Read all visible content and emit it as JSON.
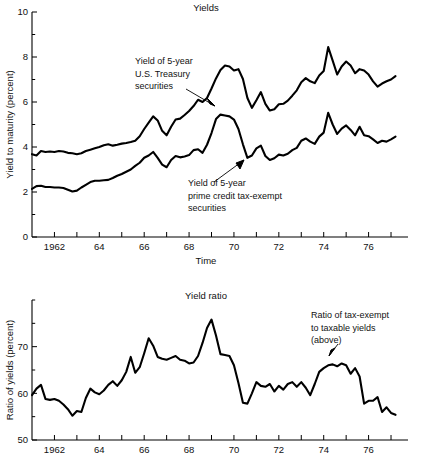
{
  "figure": {
    "background": "#ffffff",
    "line_color": "#000000"
  },
  "chart_data": [
    {
      "id": "yields",
      "type": "line",
      "title": "Yields",
      "xlabel": "Time",
      "ylabel": "Yield to maturity (percent)",
      "xlim": [
        1961.0,
        1977.4
      ],
      "ylim": [
        0,
        10
      ],
      "yticks": [
        0,
        2,
        4,
        6,
        8,
        10
      ],
      "ytick_labels": [
        "0",
        "2",
        "4",
        "6",
        "8",
        "10"
      ],
      "yminor_step": 1,
      "xticks": [
        1962,
        1963,
        1964,
        1965,
        1966,
        1967,
        1968,
        1969,
        1970,
        1971,
        1972,
        1973,
        1974,
        1975,
        1976,
        1977
      ],
      "xtick_labels": [
        "1962",
        "",
        "64",
        "",
        "66",
        "",
        "68",
        "",
        "70",
        "",
        "72",
        "",
        "74",
        "",
        "76",
        ""
      ],
      "grid": false,
      "legend": "none",
      "annotations": [
        {
          "id": "treasury-annotation",
          "text_lines": [
            "Yield of 5-year",
            "U.S. Treasury",
            "securities"
          ],
          "points_to": "upper line near 1968.4, 6.1"
        },
        {
          "id": "tax-exempt-annotation",
          "text_lines": [
            "Yield of 5-year",
            "prime credit tax-exempt",
            "securities"
          ],
          "points_to": "lower line near 1970.5, 3.5"
        }
      ],
      "series": [
        {
          "name": "Yield of 5-year U.S. Treasury securities",
          "x": [
            1961.0,
            1961.2,
            1961.4,
            1961.6,
            1961.8,
            1962.0,
            1962.2,
            1962.4,
            1962.6,
            1962.8,
            1963.0,
            1963.2,
            1963.4,
            1963.6,
            1963.8,
            1964.0,
            1964.2,
            1964.4,
            1964.6,
            1964.8,
            1965.0,
            1965.2,
            1965.4,
            1965.6,
            1965.8,
            1966.0,
            1966.2,
            1966.4,
            1966.6,
            1966.8,
            1967.0,
            1967.2,
            1967.4,
            1967.6,
            1967.8,
            1968.0,
            1968.2,
            1968.4,
            1968.6,
            1968.8,
            1969.0,
            1969.2,
            1969.4,
            1969.6,
            1969.8,
            1970.0,
            1970.2,
            1970.4,
            1970.6,
            1970.8,
            1971.0,
            1971.2,
            1971.4,
            1971.6,
            1971.8,
            1972.0,
            1972.2,
            1972.4,
            1972.6,
            1972.8,
            1973.0,
            1973.2,
            1973.4,
            1973.6,
            1973.8,
            1974.0,
            1974.2,
            1974.4,
            1974.6,
            1974.8,
            1975.0,
            1975.2,
            1975.4,
            1975.6,
            1975.8,
            1976.0,
            1976.2,
            1976.4,
            1976.6,
            1976.8,
            1977.0,
            1977.2
          ],
          "y": [
            3.68,
            3.62,
            3.82,
            3.78,
            3.8,
            3.78,
            3.82,
            3.8,
            3.74,
            3.72,
            3.68,
            3.72,
            3.82,
            3.88,
            3.94,
            4.0,
            4.08,
            4.12,
            4.06,
            4.1,
            4.15,
            4.18,
            4.22,
            4.28,
            4.48,
            4.8,
            5.08,
            5.36,
            5.18,
            4.72,
            4.52,
            4.9,
            5.22,
            5.26,
            5.42,
            5.6,
            5.82,
            6.1,
            6.0,
            6.18,
            6.6,
            7.05,
            7.42,
            7.62,
            7.58,
            7.4,
            7.46,
            7.02,
            6.18,
            5.74,
            6.08,
            6.44,
            5.92,
            5.62,
            5.68,
            5.9,
            5.92,
            6.06,
            6.28,
            6.52,
            6.88,
            7.06,
            6.92,
            6.84,
            7.18,
            7.38,
            8.44,
            7.84,
            7.22,
            7.58,
            7.8,
            7.62,
            7.28,
            7.46,
            7.4,
            7.22,
            6.92,
            6.68,
            6.82,
            6.92,
            7.0,
            7.15
          ]
        },
        {
          "name": "Yield of 5-year prime credit tax-exempt securities",
          "x": [
            1961.0,
            1961.2,
            1961.4,
            1961.6,
            1961.8,
            1962.0,
            1962.2,
            1962.4,
            1962.6,
            1962.8,
            1963.0,
            1963.2,
            1963.4,
            1963.6,
            1963.8,
            1964.0,
            1964.2,
            1964.4,
            1964.6,
            1964.8,
            1965.0,
            1965.2,
            1965.4,
            1965.6,
            1965.8,
            1966.0,
            1966.2,
            1966.4,
            1966.6,
            1966.8,
            1967.0,
            1967.2,
            1967.4,
            1967.6,
            1967.8,
            1968.0,
            1968.2,
            1968.4,
            1968.6,
            1968.8,
            1969.0,
            1969.2,
            1969.4,
            1969.6,
            1969.8,
            1970.0,
            1970.2,
            1970.4,
            1970.6,
            1970.8,
            1971.0,
            1971.2,
            1971.4,
            1971.6,
            1971.8,
            1972.0,
            1972.2,
            1972.4,
            1972.6,
            1972.8,
            1973.0,
            1973.2,
            1973.4,
            1973.6,
            1973.8,
            1974.0,
            1974.2,
            1974.4,
            1974.6,
            1974.8,
            1975.0,
            1975.2,
            1975.4,
            1975.6,
            1975.8,
            1976.0,
            1976.2,
            1976.4,
            1976.6,
            1976.8,
            1977.0,
            1977.2
          ],
          "y": [
            2.14,
            2.26,
            2.28,
            2.22,
            2.22,
            2.2,
            2.2,
            2.18,
            2.1,
            2.02,
            2.06,
            2.2,
            2.32,
            2.44,
            2.5,
            2.5,
            2.52,
            2.54,
            2.62,
            2.72,
            2.8,
            2.9,
            3.0,
            3.16,
            3.3,
            3.52,
            3.62,
            3.78,
            3.52,
            3.22,
            3.1,
            3.42,
            3.6,
            3.54,
            3.58,
            3.64,
            3.86,
            3.9,
            3.74,
            4.1,
            4.62,
            5.24,
            5.44,
            5.4,
            5.36,
            5.22,
            4.8,
            4.12,
            3.52,
            3.62,
            3.94,
            4.06,
            3.6,
            3.42,
            3.5,
            3.66,
            3.62,
            3.7,
            3.86,
            3.96,
            4.28,
            4.38,
            4.24,
            4.14,
            4.46,
            4.64,
            5.52,
            5.0,
            4.58,
            4.82,
            4.96,
            4.76,
            4.52,
            4.9,
            4.52,
            4.48,
            4.34,
            4.18,
            4.28,
            4.24,
            4.34,
            4.46
          ]
        }
      ]
    },
    {
      "id": "yield-ratio",
      "type": "line",
      "title": "Yield ratio",
      "xlabel": "",
      "ylabel": "Ratio of yields (percent)",
      "xlim": [
        1961.0,
        1977.4
      ],
      "ylim": [
        50,
        80
      ],
      "yticks": [
        50,
        60,
        70
      ],
      "ytick_labels": [
        "50",
        "60",
        "70"
      ],
      "yminor_step": 5,
      "xticks": [
        1962,
        1963,
        1964,
        1965,
        1966,
        1967,
        1968,
        1969,
        1970,
        1971,
        1972,
        1973,
        1974,
        1975,
        1976,
        1977
      ],
      "xtick_labels": [
        "1962",
        "",
        "64",
        "",
        "66",
        "",
        "68",
        "",
        "70",
        "",
        "72",
        "",
        "74",
        "",
        "76",
        ""
      ],
      "grid": false,
      "legend": "none",
      "annotations": [
        {
          "id": "ratio-annotation",
          "text_lines": [
            "Ratio of tax-exempt",
            "to taxable yields",
            "(above)"
          ],
          "points_to": "line near 1975.2, 66"
        }
      ],
      "series": [
        {
          "name": "Ratio of tax-exempt to taxable yields",
          "x": [
            1961.0,
            1961.2,
            1961.4,
            1961.6,
            1961.8,
            1962.0,
            1962.2,
            1962.4,
            1962.6,
            1962.8,
            1963.0,
            1963.2,
            1963.4,
            1963.6,
            1963.8,
            1964.0,
            1964.2,
            1964.4,
            1964.6,
            1964.8,
            1965.0,
            1965.2,
            1965.4,
            1965.6,
            1965.8,
            1966.0,
            1966.2,
            1966.4,
            1966.6,
            1966.8,
            1967.0,
            1967.2,
            1967.4,
            1967.6,
            1967.8,
            1968.0,
            1968.2,
            1968.4,
            1968.6,
            1968.8,
            1969.0,
            1969.2,
            1969.4,
            1969.6,
            1969.8,
            1970.0,
            1970.2,
            1970.4,
            1970.6,
            1970.8,
            1971.0,
            1971.2,
            1971.4,
            1971.6,
            1971.8,
            1972.0,
            1972.2,
            1972.4,
            1972.6,
            1972.8,
            1973.0,
            1973.2,
            1973.4,
            1973.6,
            1973.8,
            1974.0,
            1974.2,
            1974.4,
            1974.6,
            1974.8,
            1975.0,
            1975.2,
            1975.4,
            1975.6,
            1975.8,
            1976.0,
            1976.2,
            1976.4,
            1976.6,
            1976.8,
            1977.0,
            1977.2
          ],
          "y": [
            59.6,
            61.0,
            61.8,
            58.8,
            58.6,
            58.8,
            58.4,
            57.6,
            56.6,
            55.2,
            56.2,
            56.0,
            59.0,
            61.0,
            60.2,
            59.8,
            60.6,
            61.8,
            62.6,
            61.6,
            62.8,
            64.6,
            67.8,
            64.4,
            65.6,
            68.6,
            71.8,
            70.2,
            67.8,
            67.4,
            67.2,
            67.6,
            68.0,
            67.2,
            67.0,
            66.4,
            66.6,
            68.0,
            70.8,
            74.0,
            75.8,
            72.4,
            68.4,
            68.2,
            68.0,
            66.0,
            62.2,
            58.0,
            57.8,
            60.0,
            62.4,
            61.6,
            61.4,
            62.0,
            60.4,
            61.6,
            60.8,
            62.0,
            62.4,
            61.4,
            62.4,
            61.2,
            59.6,
            62.0,
            64.6,
            65.4,
            66.0,
            66.2,
            65.8,
            66.4,
            66.0,
            64.2,
            65.4,
            63.6,
            57.8,
            58.4,
            58.4,
            59.2,
            56.0,
            57.0,
            55.8,
            55.4
          ]
        }
      ]
    }
  ]
}
